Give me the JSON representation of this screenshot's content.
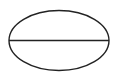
{
  "diagram": {
    "shape": "ellipse",
    "stroke_color": "#222222",
    "background": "#ffffff",
    "ellipse": {
      "cx": 59,
      "cy": 40.5,
      "rx": 50,
      "ry": 30
    },
    "diameter_line": {
      "x1": 9,
      "y1": 40.5,
      "x2": 109,
      "y2": 40.5
    }
  }
}
